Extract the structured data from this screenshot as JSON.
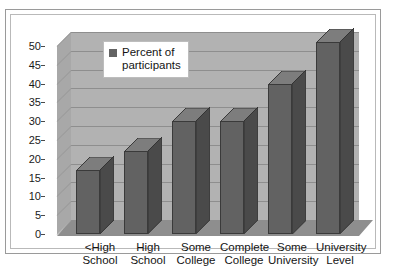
{
  "chart_data": {
    "type": "bar",
    "title": "",
    "subtitle": "",
    "xlabel": "",
    "ylabel": "",
    "categories": [
      "<High\nSchool",
      "High\nSchool",
      "Some\nCollege",
      "Complete\nCollege",
      "Some\nUniversity",
      "University\nLevel"
    ],
    "series": [
      {
        "name": "Percent of\nparticipants",
        "values": [
          17,
          22,
          30,
          30,
          40,
          51
        ]
      }
    ],
    "values": [
      17,
      22,
      30,
      30,
      40,
      51
    ],
    "ylim": [
      0,
      50
    ],
    "ytick_labels": [
      "50",
      "45",
      "40",
      "35",
      "30",
      "25",
      "20",
      "15",
      "10",
      "5",
      "0"
    ],
    "ytick_values": [
      50,
      45,
      40,
      35,
      30,
      25,
      20,
      15,
      10,
      5,
      0
    ],
    "grid": true,
    "three_d": true,
    "legend": {
      "position": "inside-top-left",
      "entries": [
        {
          "label": "Percent of\nparticipants",
          "color": "#636363"
        }
      ]
    },
    "colors": {
      "bar_front": "#626262",
      "bar_side": "#4a4a4a",
      "bar_top": "#7d7d7d",
      "plot_back_wall": "#b2b2b2",
      "plot_side_wall": "#a8a8a8",
      "floor": "#8e8e8e",
      "gridline": "#8e8e8e",
      "axis_text": "#141414",
      "frame_border": "#9a9a9a"
    }
  }
}
